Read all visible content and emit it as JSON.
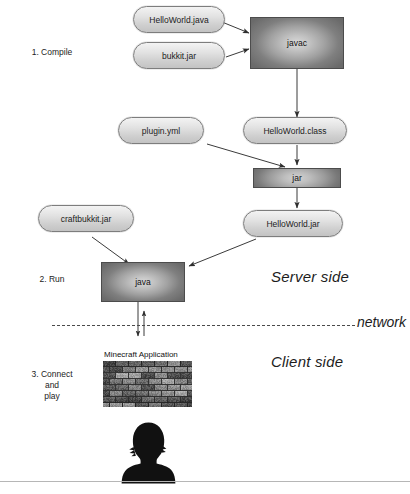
{
  "diagram": {
    "background": "#ffffff",
    "stroke_color": "#3b3b3b",
    "steps": [
      {
        "id": "step-compile",
        "label": "1. Compile"
      },
      {
        "id": "step-run",
        "label": "2. Run"
      },
      {
        "id": "step-connect",
        "label": "3. Connect\nand\nplay"
      }
    ],
    "zones": [
      {
        "id": "server-side",
        "label": "Server side"
      },
      {
        "id": "client-side",
        "label": "Client side"
      }
    ],
    "network": {
      "label": "network"
    },
    "nodes": [
      {
        "id": "helloworld-java",
        "label": "HelloWorld.java",
        "shape": "pill"
      },
      {
        "id": "bukkit-jar",
        "label": "bukkit.jar",
        "shape": "pill"
      },
      {
        "id": "javac",
        "label": "javac",
        "shape": "box"
      },
      {
        "id": "plugin-yml",
        "label": "plugin.yml",
        "shape": "pill"
      },
      {
        "id": "helloworld-class",
        "label": "HelloWorld.class",
        "shape": "pill"
      },
      {
        "id": "jar",
        "label": "jar",
        "shape": "box"
      },
      {
        "id": "helloworld-jar",
        "label": "HelloWorld.jar",
        "shape": "pill"
      },
      {
        "id": "craftbukkit-jar",
        "label": "craftbukkit.jar",
        "shape": "pill"
      },
      {
        "id": "java",
        "label": "java",
        "shape": "box"
      }
    ],
    "edges": [
      {
        "from": "helloworld-java",
        "to": "javac"
      },
      {
        "from": "bukkit-jar",
        "to": "javac"
      },
      {
        "from": "javac",
        "to": "helloworld-class"
      },
      {
        "from": "helloworld-class",
        "to": "jar"
      },
      {
        "from": "plugin-yml",
        "to": "jar"
      },
      {
        "from": "jar",
        "to": "helloworld-jar"
      },
      {
        "from": "helloworld-jar",
        "to": "java"
      },
      {
        "from": "craftbukkit-jar",
        "to": "java"
      },
      {
        "from": "java",
        "to": "client",
        "direction": "both",
        "crosses": "network"
      }
    ],
    "client": {
      "app_caption": "Minecraft Application",
      "avatar": "player-silhouette"
    }
  }
}
